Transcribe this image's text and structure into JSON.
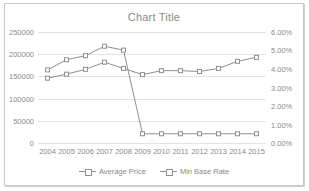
{
  "chart_data": {
    "type": "line",
    "title": "Chart Title",
    "xlabel": "",
    "ylabel": "",
    "grid": true,
    "legend_position": "bottom",
    "categories": [
      "2004",
      "2005",
      "2006",
      "2007",
      "2008",
      "2009",
      "2010",
      "2011",
      "2012",
      "2013",
      "2014",
      "2015"
    ],
    "axes": {
      "left": {
        "label": "",
        "ylim": [
          0,
          250000
        ],
        "ticks": [
          0,
          50000,
          100000,
          150000,
          200000,
          250000
        ],
        "tick_labels": [
          "0",
          "50000",
          "100000",
          "150000",
          "200000",
          "250000"
        ]
      },
      "right": {
        "label": "",
        "ylim": [
          0,
          0.06
        ],
        "ticks": [
          0,
          0.01,
          0.02,
          0.03,
          0.04,
          0.05,
          0.06
        ],
        "tick_labels": [
          "0.00%",
          "1.00%",
          "2.00%",
          "3.00%",
          "4.00%",
          "5.00%",
          "6.00%"
        ]
      }
    },
    "series": [
      {
        "name": "Average Price",
        "axis": "left",
        "color": "#8f8f8f",
        "marker": "square",
        "values": [
          146000,
          155000,
          166000,
          182000,
          168000,
          154000,
          163000,
          163000,
          161000,
          168000,
          184000,
          193000
        ]
      },
      {
        "name": "Min Base Rate",
        "axis": "right",
        "color": "#8f8f8f",
        "marker": "square",
        "values": [
          0.0395,
          0.045,
          0.0472,
          0.0523,
          0.0502,
          0.005,
          0.005,
          0.005,
          0.005,
          0.005,
          0.005,
          0.005
        ]
      }
    ]
  }
}
